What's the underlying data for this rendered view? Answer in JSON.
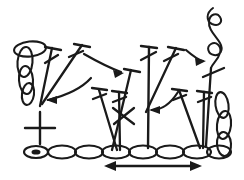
{
  "figure": {
    "kind": "crochet-stitch-diagram",
    "style": "hand-drawn line art",
    "background_color": "#ffffff",
    "ink_color": "#1a1a1a",
    "width": 244,
    "height": 180
  },
  "foundation_chain": {
    "label": "foundation chain",
    "stitch_symbol": "chain-stitch-oval",
    "link_count": 8,
    "baseline_y": 152,
    "start_x": 28,
    "end_x": 224,
    "slip_knot_marker": {
      "label": "slip knot",
      "x": 36,
      "y": 152,
      "filled": true
    }
  },
  "direction_arrow": {
    "label": "work direction",
    "type": "double-headed-arrow",
    "x1": 108,
    "x2": 198,
    "y": 166,
    "left_head": true,
    "right_head": true
  },
  "tall_stitches": {
    "label": "treble crochet stitches",
    "symbol": "vertical-stem-with-top-bar-and-slash",
    "items": [
      {
        "id": "st-1",
        "top_x": 52,
        "top_y": 48,
        "bottom_x": 40,
        "bottom_y": 106,
        "bar": true,
        "slash": true
      },
      {
        "id": "st-2",
        "top_x": 82,
        "top_y": 45,
        "bottom_x": 42,
        "bottom_y": 104,
        "bar": true,
        "slash": true
      },
      {
        "id": "st-3",
        "top_x": 131,
        "top_y": 70,
        "bottom_x": 112,
        "bottom_y": 150,
        "bar": true,
        "slash": true
      },
      {
        "id": "st-4",
        "top_x": 99,
        "top_y": 90,
        "bottom_x": 117,
        "bottom_y": 150,
        "bar": true,
        "slash": true
      },
      {
        "id": "st-5",
        "top_x": 119,
        "top_y": 92,
        "bottom_x": 120,
        "bottom_y": 150,
        "bar": true,
        "slash": true
      },
      {
        "id": "st-6",
        "top_x": 149,
        "top_y": 47,
        "bottom_x": 148,
        "bottom_y": 148,
        "bar": true,
        "slash": true
      },
      {
        "id": "st-7",
        "top_x": 176,
        "top_y": 48,
        "bottom_x": 146,
        "bottom_y": 112,
        "bar": true,
        "slash": true
      },
      {
        "id": "st-8",
        "top_x": 179,
        "top_y": 90,
        "bottom_x": 200,
        "bottom_y": 148,
        "bar": true,
        "slash": true
      },
      {
        "id": "st-9",
        "top_x": 204,
        "top_y": 92,
        "bottom_x": 203,
        "bottom_y": 148,
        "bar": true,
        "slash": true
      },
      {
        "id": "st-10",
        "top_x": 211,
        "top_y": 68,
        "bottom_x": 206,
        "bottom_y": 146,
        "bar": true,
        "slash": true
      }
    ]
  },
  "single_crochet": {
    "label": "single crochet cross symbol",
    "symbol": "plus-cross",
    "x": 40,
    "y": 128,
    "arm": 16
  },
  "turning_chains": [
    {
      "id": "left-turning-chain",
      "label": "left turning chain loops",
      "loop_count": 3,
      "x": 24,
      "top_y": 44,
      "bottom_y": 100,
      "orientation": "vertical"
    },
    {
      "id": "right-turning-chain",
      "label": "right turning chain loops",
      "loop_count": 3,
      "x": 223,
      "top_y": 96,
      "bottom_y": 152,
      "orientation": "vertical"
    }
  ],
  "yarn_tail": {
    "label": "yarn tail",
    "position": "top-right",
    "x": 214,
    "y": 10
  },
  "guide_arrows": [
    {
      "id": "arrow-left",
      "label": "hook path arrow pointing left",
      "direction": "left",
      "tip_x": 46,
      "tip_y": 100
    },
    {
      "id": "arrow-center",
      "label": "hook path arrow pointing right",
      "direction": "right",
      "tip_x": 123,
      "tip_y": 72
    },
    {
      "id": "arrow-right-center",
      "label": "hook path arrow pointing left",
      "direction": "left",
      "tip_x": 150,
      "tip_y": 110
    },
    {
      "id": "arrow-top-right",
      "label": "hook path arrow pointing right",
      "direction": "right",
      "tip_x": 205,
      "tip_y": 60
    }
  ]
}
